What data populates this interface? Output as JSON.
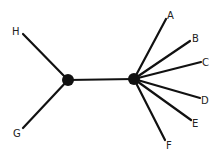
{
  "diagram": {
    "type": "unrooted-tree",
    "colors": {
      "line": "#111111",
      "node": "#111111",
      "label": "#222222",
      "background": "#ffffff"
    },
    "internal_nodes": [
      {
        "id": "n1",
        "x": 68,
        "y": 80,
        "r": 6
      },
      {
        "id": "n2",
        "x": 134,
        "y": 79,
        "r": 6
      }
    ],
    "edges": [
      {
        "from": "n1",
        "to": "n2"
      },
      {
        "from": "n1",
        "to": "H"
      },
      {
        "from": "n1",
        "to": "G"
      },
      {
        "from": "n2",
        "to": "A"
      },
      {
        "from": "n2",
        "to": "B"
      },
      {
        "from": "n2",
        "to": "C"
      },
      {
        "from": "n2",
        "to": "D"
      },
      {
        "from": "n2",
        "to": "E"
      },
      {
        "from": "n2",
        "to": "F"
      }
    ],
    "leaves": [
      {
        "id": "H",
        "label": "H",
        "x": 23,
        "y": 34,
        "lx": 12,
        "ly": 35
      },
      {
        "id": "G",
        "label": "G",
        "x": 23,
        "y": 128,
        "lx": 13,
        "ly": 137
      },
      {
        "id": "A",
        "label": "A",
        "x": 166,
        "y": 19,
        "lx": 167,
        "ly": 19
      },
      {
        "id": "B",
        "label": "B",
        "x": 190,
        "y": 41,
        "lx": 192,
        "ly": 42
      },
      {
        "id": "C",
        "label": "C",
        "x": 201,
        "y": 62,
        "lx": 202,
        "ly": 66
      },
      {
        "id": "D",
        "label": "D",
        "x": 200,
        "y": 98,
        "lx": 201,
        "ly": 104
      },
      {
        "id": "E",
        "label": "E",
        "x": 191,
        "y": 120,
        "lx": 192,
        "ly": 127
      },
      {
        "id": "F",
        "label": "F",
        "x": 165,
        "y": 140,
        "lx": 166,
        "ly": 149
      }
    ]
  }
}
